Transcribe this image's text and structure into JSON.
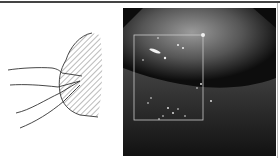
{
  "figure": {
    "left_panel": {
      "type": "line-drawing",
      "description": "schematic sketch with hatched region and protruding lines"
    },
    "right_panel": {
      "type": "grayscale-photo",
      "overlay": "rectangular region of interest"
    },
    "colors": {
      "rule": "#444444",
      "sketch_stroke": "#333333",
      "roi_box": "#c8c8c8"
    }
  }
}
